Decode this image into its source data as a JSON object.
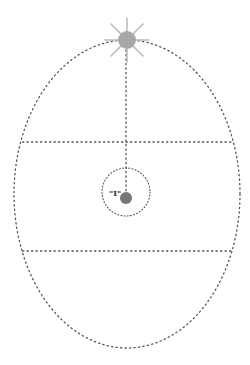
{
  "diagram": {
    "labels": {
      "inner_label": "\"I\""
    },
    "colors": {
      "dots": "#555555",
      "star": "#aaaaaa",
      "planet": "#777777"
    },
    "ellipse": {
      "cx": 127,
      "cy": 194,
      "rx": 113,
      "ry": 154
    },
    "horizontal_lines_y": [
      142,
      251
    ],
    "star": {
      "cx": 127,
      "cy": 40,
      "r": 9
    },
    "inner_circle": {
      "cx": 126,
      "cy": 192,
      "r": 24
    },
    "planet": {
      "cx": 126,
      "cy": 198,
      "r": 6
    }
  }
}
